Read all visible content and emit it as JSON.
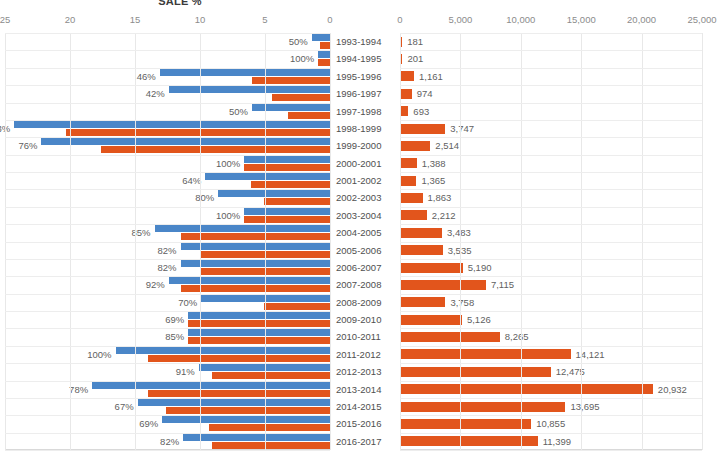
{
  "chart_data": {
    "type": "bar",
    "title": "SALE %",
    "orientation": "horizontal-paired-panels",
    "categories": [
      "1993-1994",
      "1994-1995",
      "1995-1996",
      "1996-1997",
      "1997-1998",
      "1998-1999",
      "1999-2000",
      "2000-2001",
      "2001-2002",
      "2002-2003",
      "2003-2004",
      "2004-2005",
      "2005-2006",
      "2006-2007",
      "2007-2008",
      "2008-2009",
      "2009-2010",
      "2010-2011",
      "2011-2012",
      "2012-2013",
      "2013-2014",
      "2014-2015",
      "2015-2016",
      "2016-2017"
    ],
    "left_panel": {
      "title": "SALE %",
      "xlabel": "",
      "ylabel": "",
      "xlim": [
        25,
        0
      ],
      "direction": "right-to-left",
      "grid": true,
      "tick_labels": [
        "25",
        "20",
        "15",
        "10",
        "5",
        "0"
      ],
      "tick_values": [
        25,
        20,
        15,
        10,
        5,
        0
      ],
      "series": [
        {
          "name": "blue-series",
          "color": "#4a86c8",
          "values": [
            1.4,
            0.9,
            13.1,
            12.4,
            6.0,
            24.3,
            22.2,
            6.6,
            9.6,
            8.6,
            6.6,
            13.5,
            11.5,
            11.5,
            12.4,
            9.9,
            10.9,
            10.9,
            16.5,
            10.1,
            18.3,
            14.8,
            12.9,
            11.3
          ],
          "data_labels": [
            "50%",
            "100%",
            "46%",
            "42%",
            "50%",
            "83%",
            "76%",
            "100%",
            "64%",
            "80%",
            "100%",
            "85%",
            "82%",
            "82%",
            "92%",
            "70%",
            "69%",
            "85%",
            "100%",
            "91%",
            "78%",
            "67%",
            "69%",
            "82%"
          ]
        },
        {
          "name": "orange-series",
          "color": "#e2551c",
          "values": [
            0.8,
            0.9,
            6.0,
            4.5,
            3.2,
            20.3,
            17.6,
            6.6,
            6.1,
            5.1,
            6.6,
            11.5,
            9.9,
            9.9,
            11.5,
            5.1,
            10.9,
            10.9,
            14.0,
            9.1,
            14.0,
            12.6,
            9.3,
            9.1
          ]
        }
      ]
    },
    "right_panel": {
      "xlabel": "",
      "ylabel": "",
      "xlim": [
        0,
        25000
      ],
      "direction": "left-to-right",
      "grid": true,
      "tick_labels": [
        "0",
        "5,000",
        "10,000",
        "15,000",
        "20,000",
        "25,000"
      ],
      "tick_values": [
        0,
        5000,
        10000,
        15000,
        20000,
        25000
      ],
      "series": [
        {
          "name": "sales-count",
          "color": "#e2551c",
          "values": [
            181,
            201,
            1161,
            974,
            693,
            3747,
            2514,
            1388,
            1365,
            1863,
            2212,
            3483,
            3535,
            5190,
            7115,
            3758,
            5126,
            8265,
            14121,
            12475,
            20932,
            13695,
            10855,
            11399
          ],
          "data_labels": [
            "181",
            "201",
            "1,161",
            "974",
            "693",
            "3,747",
            "2,514",
            "1,388",
            "1,365",
            "1,863",
            "2,212",
            "3,483",
            "3,535",
            "5,190",
            "7,115",
            "3,758",
            "5,126",
            "8,265",
            "14,121",
            "12,475",
            "20,932",
            "13,695",
            "10,855",
            "11,399"
          ]
        }
      ]
    }
  },
  "colors": {
    "blue": "#4a86c8",
    "orange": "#e2551c",
    "grid": "#e8e8e8",
    "text": "#5f5f5f"
  }
}
